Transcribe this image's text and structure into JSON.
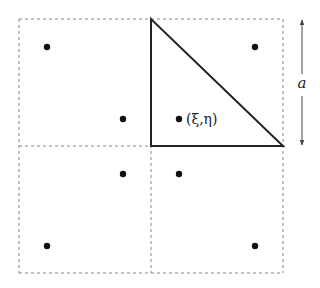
{
  "diagram": {
    "grid": {
      "x0": 19,
      "y0": 19,
      "x1": 283,
      "y1": 273,
      "xm": 151,
      "ym": 146,
      "stroke": "#888888",
      "dash": "3,3"
    },
    "triangle": {
      "points": [
        [
          151,
          19
        ],
        [
          151,
          146
        ],
        [
          283,
          146
        ]
      ],
      "stroke": "#222222"
    },
    "dots": [
      {
        "x": 47,
        "y": 47
      },
      {
        "x": 255,
        "y": 47
      },
      {
        "x": 123,
        "y": 119
      },
      {
        "x": 179,
        "y": 119
      },
      {
        "x": 123,
        "y": 174
      },
      {
        "x": 179,
        "y": 174
      },
      {
        "x": 47,
        "y": 246
      },
      {
        "x": 255,
        "y": 246
      }
    ],
    "point_label": {
      "text": "(ξ,η)",
      "x": 186,
      "y": 124
    },
    "dimension": {
      "label": "a",
      "x": 302,
      "y_top": 19,
      "y_bottom": 146,
      "label_y": 88
    }
  }
}
